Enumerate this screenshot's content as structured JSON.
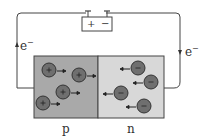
{
  "diagram": {
    "title": "",
    "battery": {
      "positive": "+",
      "negative": "−"
    },
    "electron_label_left": "e",
    "electron_label_right": "e",
    "electron_sup": "−",
    "regions": [
      {
        "name": "p",
        "label": "p",
        "fill": "#a9a9a9",
        "carrier_sign": "+"
      },
      {
        "name": "n",
        "label": "n",
        "fill": "#d8d8d8",
        "carrier_sign": "−"
      }
    ],
    "holes": [
      {
        "x": 49,
        "y": 70
      },
      {
        "x": 79,
        "y": 75
      },
      {
        "x": 63,
        "y": 92
      },
      {
        "x": 43,
        "y": 103
      }
    ],
    "electrons": [
      {
        "x": 138,
        "y": 68
      },
      {
        "x": 151,
        "y": 82
      },
      {
        "x": 121,
        "y": 93
      },
      {
        "x": 144,
        "y": 106
      }
    ],
    "colors": {
      "wire": "#444444",
      "carrier": "#6f6f6f",
      "stroke": "#333333"
    }
  }
}
